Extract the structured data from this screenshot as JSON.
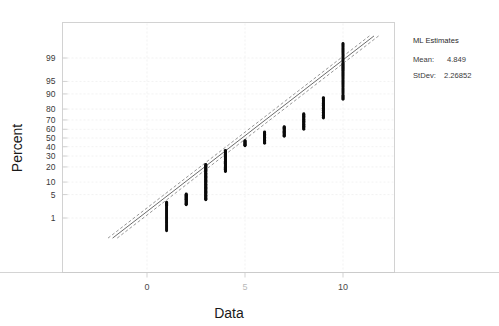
{
  "chart_data": {
    "type": "scatter",
    "title": "",
    "subtitle": "",
    "xlabel": "Data",
    "ylabel": "Percent",
    "plot_kind": "normal-probability-plot",
    "xlim": [
      -3.2,
      12.5
    ],
    "ylim_percent": [
      0.15,
      99.9
    ],
    "xticks": [
      0,
      5,
      10
    ],
    "xtick_labels": [
      "0",
      "5",
      "10"
    ],
    "yticks_percent": [
      1,
      5,
      10,
      20,
      30,
      40,
      50,
      60,
      70,
      80,
      90,
      95,
      99
    ],
    "ytick_labels": [
      "1",
      "5",
      "10",
      "20",
      "30",
      "40",
      "50",
      "60",
      "70",
      "80",
      "90",
      "95",
      "99"
    ],
    "grid": true,
    "legend_position": "right-outside",
    "fit_line": {
      "label": "ML fit",
      "style": "solid",
      "mean": 4.849,
      "stdev": 2.26852
    },
    "confidence_bands": {
      "style": "dashed",
      "count": 2
    },
    "series": [
      {
        "name": "Data",
        "marker": "filled-circle",
        "color": "#0a0a0a",
        "note": "Discrete integer data values 1-10; each column is a stack of tied observations plotted at ascending percent positions.",
        "columns": [
          {
            "x": 1,
            "count": 30,
            "percent_low": 0.35,
            "percent_high": 3.1
          },
          {
            "x": 2,
            "count": 24,
            "percent_low": 2.6,
            "percent_high": 5.2
          },
          {
            "x": 3,
            "count": 62,
            "percent_low": 3.6,
            "percent_high": 22.0
          },
          {
            "x": 4,
            "count": 40,
            "percent_low": 16.5,
            "percent_high": 36.0
          },
          {
            "x": 5,
            "count": 12,
            "percent_low": 41.0,
            "percent_high": 47.0
          },
          {
            "x": 6,
            "count": 20,
            "percent_low": 44.0,
            "percent_high": 57.0
          },
          {
            "x": 7,
            "count": 18,
            "percent_low": 52.0,
            "percent_high": 63.0
          },
          {
            "x": 8,
            "count": 26,
            "percent_low": 60.0,
            "percent_high": 76.0
          },
          {
            "x": 9,
            "count": 30,
            "percent_low": 72.0,
            "percent_high": 88.0
          },
          {
            "x": 10,
            "count": 55,
            "percent_low": 87.0,
            "percent_high": 99.7
          }
        ]
      }
    ]
  },
  "legend": {
    "title": "ML Estimates",
    "rows": [
      {
        "label": "Mean:",
        "value": "4.849"
      },
      {
        "label": "StDev:",
        "value": "2.26852"
      }
    ]
  },
  "axes": {
    "x_title": "Data",
    "y_title": "Percent"
  }
}
